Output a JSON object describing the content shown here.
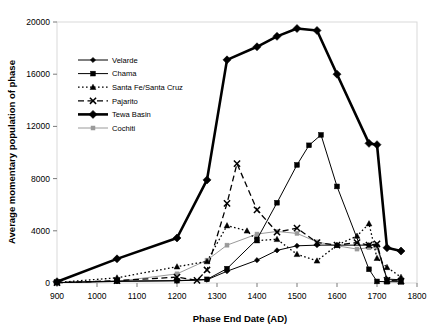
{
  "chart_data": {
    "type": "line",
    "title": "",
    "xlabel": "Phase End Date (AD)",
    "ylabel": "Average momentary population of phase",
    "xlim": [
      900,
      1800
    ],
    "ylim": [
      0,
      20000
    ],
    "xticks": [
      900,
      1000,
      1100,
      1200,
      1300,
      1400,
      1500,
      1600,
      1700,
      1800
    ],
    "yticks": [
      0,
      4000,
      8000,
      12000,
      16000,
      20000
    ],
    "grid": false,
    "legend_position": "upper-left-inside",
    "series": [
      {
        "name": "Velarde",
        "marker": "diamond",
        "line": "solid",
        "color": "#000000",
        "points": [
          [
            900,
            30
          ],
          [
            1050,
            120
          ],
          [
            1200,
            170
          ],
          [
            1275,
            250
          ],
          [
            1325,
            900
          ],
          [
            1400,
            1750
          ],
          [
            1450,
            2500
          ],
          [
            1500,
            2850
          ],
          [
            1550,
            2900
          ],
          [
            1600,
            2900
          ],
          [
            1680,
            2900
          ],
          [
            1700,
            2900
          ],
          [
            1725,
            300
          ],
          [
            1760,
            250
          ]
        ]
      },
      {
        "name": "Chama",
        "marker": "square",
        "line": "solid",
        "color": "#555555",
        "points": [
          [
            900,
            30
          ],
          [
            1050,
            150
          ],
          [
            1200,
            180
          ],
          [
            1275,
            280
          ],
          [
            1325,
            1100
          ],
          [
            1400,
            3350
          ],
          [
            1450,
            6150
          ],
          [
            1500,
            9050
          ],
          [
            1530,
            10550
          ],
          [
            1560,
            11350
          ],
          [
            1600,
            7400
          ],
          [
            1680,
            1050
          ],
          [
            1700,
            120
          ],
          [
            1725,
            100
          ],
          [
            1760,
            90
          ]
        ]
      },
      {
        "name": "Santa Fe/Santa Cruz",
        "marker": "triangle",
        "line": "dotted",
        "color": "#000000",
        "points": [
          [
            900,
            40
          ],
          [
            1050,
            400
          ],
          [
            1200,
            1250
          ],
          [
            1275,
            1650
          ],
          [
            1325,
            4400
          ],
          [
            1375,
            4000
          ],
          [
            1400,
            3250
          ],
          [
            1450,
            3350
          ],
          [
            1500,
            2200
          ],
          [
            1550,
            1700
          ],
          [
            1600,
            2900
          ],
          [
            1650,
            3600
          ],
          [
            1680,
            4550
          ],
          [
            1700,
            1900
          ],
          [
            1725,
            1200
          ],
          [
            1760,
            450
          ]
        ]
      },
      {
        "name": "Pajarito",
        "marker": "x",
        "line": "dashed",
        "color": "#000000",
        "points": [
          [
            900,
            20
          ],
          [
            1050,
            180
          ],
          [
            1200,
            450
          ],
          [
            1250,
            200
          ],
          [
            1275,
            1000
          ],
          [
            1325,
            6100
          ],
          [
            1350,
            9150
          ],
          [
            1400,
            5600
          ],
          [
            1450,
            3900
          ],
          [
            1500,
            4200
          ],
          [
            1550,
            3100
          ],
          [
            1600,
            2900
          ],
          [
            1650,
            3100
          ],
          [
            1680,
            2900
          ],
          [
            1700,
            3000
          ],
          [
            1725,
            200
          ],
          [
            1760,
            150
          ]
        ]
      },
      {
        "name": "Tewa Basin",
        "marker": "diamond-large",
        "line": "solid-thick",
        "color": "#000000",
        "points": [
          [
            900,
            100
          ],
          [
            1050,
            1850
          ],
          [
            1200,
            3450
          ],
          [
            1275,
            7900
          ],
          [
            1325,
            17100
          ],
          [
            1400,
            18100
          ],
          [
            1450,
            18900
          ],
          [
            1500,
            19500
          ],
          [
            1550,
            19350
          ],
          [
            1600,
            16000
          ],
          [
            1680,
            10700
          ],
          [
            1700,
            10600
          ],
          [
            1725,
            2700
          ],
          [
            1760,
            2450
          ]
        ]
      },
      {
        "name": "Cochiti",
        "marker": "square-small",
        "line": "solid-light",
        "color": "#999999",
        "points": [
          [
            900,
            25
          ],
          [
            1050,
            120
          ],
          [
            1200,
            700
          ],
          [
            1275,
            1750
          ],
          [
            1325,
            2900
          ],
          [
            1400,
            3750
          ],
          [
            1450,
            3950
          ],
          [
            1500,
            3800
          ],
          [
            1550,
            3150
          ],
          [
            1600,
            2850
          ],
          [
            1650,
            2600
          ],
          [
            1680,
            2700
          ],
          [
            1700,
            2700
          ],
          [
            1725,
            250
          ],
          [
            1760,
            200
          ]
        ]
      }
    ]
  },
  "legend": {
    "items": [
      {
        "label": "Velarde"
      },
      {
        "label": "Chama"
      },
      {
        "label": "Santa Fe/Santa Cruz"
      },
      {
        "label": "Pajarito"
      },
      {
        "label": "Tewa Basin"
      },
      {
        "label": "Cochiti"
      }
    ]
  }
}
